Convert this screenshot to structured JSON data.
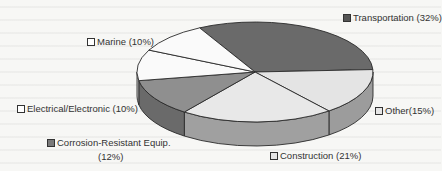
{
  "chart_data": {
    "type": "pie",
    "style": "3d",
    "title": "",
    "categories": [
      "Transportation",
      "Other",
      "Construction",
      "Corrosion-Resistant Equip.",
      "Electrical/Electronic",
      "Marine"
    ],
    "values": [
      32,
      15,
      21,
      12,
      10,
      10
    ],
    "unit": "%",
    "colors": [
      "#6a6a6a",
      "#e4e4e4",
      "#e8e8e8",
      "#8f8f8f",
      "#fafafa",
      "#fafafa"
    ],
    "labels": [
      "Transportation (32%)",
      "Other(15%)",
      "Construction (21%)",
      "Corrosion-Resistant Equip. (12%)",
      "Electrical/Electronic (10%)",
      "Marine (10%)"
    ],
    "legend_position": "labels-around-pie"
  },
  "labels": {
    "transportation": "Transportation (32%)",
    "other": "Other(15%)",
    "construction": "Construction (21%)",
    "corrosion_line1": "Corrosion-Resistant Equip.",
    "corrosion_line2": "(12%)",
    "electrical": "Electrical/Electronic (10%)",
    "marine": "Marine (10%)"
  },
  "swatch_colors": {
    "transportation": "#555555",
    "other": "#e6e6e6",
    "construction": "#e6e6e6",
    "corrosion": "#7a7a7a",
    "electrical": "#ffffff",
    "marine": "#ffffff"
  }
}
